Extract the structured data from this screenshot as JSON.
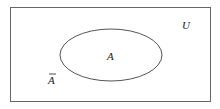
{
  "diagram": {
    "type": "venn",
    "universe": {
      "label": "U"
    },
    "set": {
      "label": "A"
    },
    "complement": {
      "label": "A",
      "overline": true
    },
    "colors": {
      "stroke": "#555555",
      "text": "#222222",
      "background": "#ffffff"
    }
  }
}
